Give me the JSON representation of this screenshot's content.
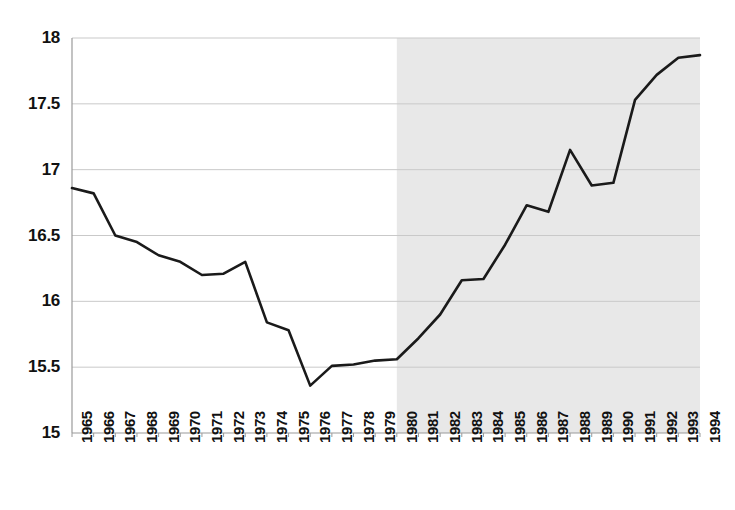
{
  "chart_data": {
    "type": "line",
    "title": "",
    "subtitle": "",
    "xlabel": "",
    "ylabel": "",
    "x": [
      1965,
      1966,
      1967,
      1968,
      1969,
      1970,
      1971,
      1972,
      1973,
      1974,
      1975,
      1976,
      1977,
      1978,
      1979,
      1980,
      1981,
      1982,
      1983,
      1984,
      1985,
      1986,
      1987,
      1988,
      1989,
      1990,
      1991,
      1992,
      1993,
      1994
    ],
    "values": [
      16.86,
      16.82,
      16.5,
      16.45,
      16.35,
      16.3,
      16.2,
      16.21,
      16.3,
      15.84,
      15.78,
      15.36,
      15.51,
      15.52,
      15.55,
      15.56,
      15.72,
      15.9,
      16.16,
      16.17,
      16.43,
      16.73,
      16.68,
      17.15,
      16.88,
      16.9,
      17.53,
      17.72,
      17.85,
      17.87
    ],
    "series": [
      {
        "name": "series-1",
        "values": [
          16.86,
          16.82,
          16.5,
          16.45,
          16.35,
          16.3,
          16.2,
          16.21,
          16.3,
          15.84,
          15.78,
          15.36,
          15.51,
          15.52,
          15.55,
          15.56,
          15.72,
          15.9,
          16.16,
          16.17,
          16.43,
          16.73,
          16.68,
          17.15,
          16.88,
          16.9,
          17.53,
          17.72,
          17.85,
          17.87
        ],
        "color": "#1a1a1a"
      }
    ],
    "categories": [
      "1965",
      "1966",
      "1967",
      "1968",
      "1969",
      "1970",
      "1971",
      "1972",
      "1973",
      "1974",
      "1975",
      "1976",
      "1977",
      "1978",
      "1979",
      "1980",
      "1981",
      "1982",
      "1983",
      "1984",
      "1985",
      "1986",
      "1987",
      "1988",
      "1989",
      "1990",
      "1991",
      "1992",
      "1993",
      "1994"
    ],
    "ylim": [
      15,
      18
    ],
    "xlim": [
      1965,
      1994
    ],
    "ytick_labels": [
      "15",
      "15.5",
      "16",
      "16.5",
      "17",
      "17.5",
      "18"
    ],
    "ytick_values": [
      15,
      15.5,
      16,
      16.5,
      17,
      17.5,
      18
    ],
    "grid": true,
    "grid_axis": "y",
    "legend": false,
    "legend_position": "none",
    "annotations": [],
    "shaded_region": {
      "name": "shaded-span",
      "start": 1980,
      "end": 1994,
      "color": "#e8e8e8"
    },
    "line_color": "#1a1a1a",
    "line_width": 2.6,
    "grid_color": "#c9c9c9",
    "axis_color": "#9a9a9a",
    "background_color": "#ffffff"
  }
}
